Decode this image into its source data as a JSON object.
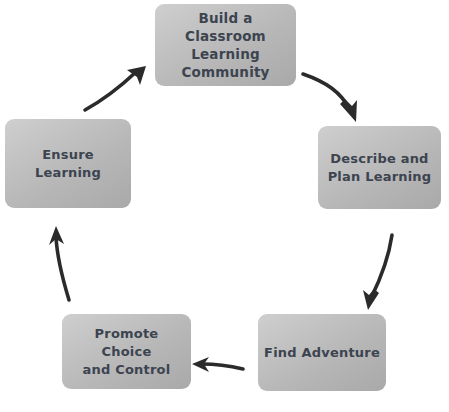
{
  "diagram": {
    "background_color": "#ffffff",
    "node_fill_color": "#c0c0c0",
    "node_text_color": "#3c4450",
    "arrow_color": "#2b2b2b",
    "flow_direction": "clockwise",
    "nodes": [
      {
        "id": "build",
        "label": "Build a\nClassroom\nLearning\nCommunity",
        "position": "top",
        "order": 1
      },
      {
        "id": "describe",
        "label": "Describe and\nPlan Learning",
        "position": "right",
        "order": 2
      },
      {
        "id": "find",
        "label": "Find Adventure",
        "position": "bottom-right",
        "order": 3
      },
      {
        "id": "promote",
        "label": "Promote Choice\nand Control",
        "position": "bottom-left",
        "order": 4
      },
      {
        "id": "ensure",
        "label": "Ensure Learning",
        "position": "left",
        "order": 5
      }
    ],
    "arrows": [
      {
        "id": "build-to-describe",
        "from": "build",
        "to": "describe",
        "direction": "down-right"
      },
      {
        "id": "describe-to-find",
        "from": "describe",
        "to": "find",
        "direction": "down-left"
      },
      {
        "id": "find-to-promote",
        "from": "find",
        "to": "promote",
        "direction": "left"
      },
      {
        "id": "promote-to-ensure",
        "from": "promote",
        "to": "ensure",
        "direction": "up"
      },
      {
        "id": "ensure-to-build",
        "from": "ensure",
        "to": "build",
        "direction": "up-right"
      }
    ]
  }
}
